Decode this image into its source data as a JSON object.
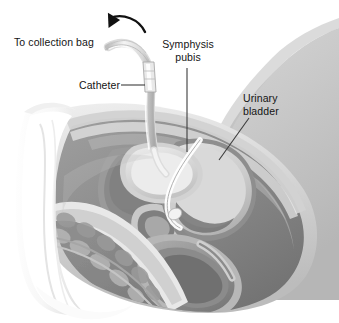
{
  "figure": {
    "type": "medical-illustration",
    "palette": {
      "background": "#ffffff",
      "body_silhouette": "#c9c9c9",
      "body_silhouette_dark": "#b4b4b4",
      "drape_white": "#fbfbfb",
      "tissue_mid": "#8f8f8f",
      "tissue_dark": "#6e6e6e",
      "tissue_light": "#d7d7d7",
      "bladder_fill": "#cfcfcf",
      "catheter_tube": "#e2e2e2",
      "catheter_outline": "#a0a0a0",
      "label_text": "#141414",
      "leader_line": "#3c3c3c",
      "arrow": "#111111"
    }
  },
  "labels": {
    "collection_bag": "To collection bag",
    "catheter": "Catheter",
    "symphysis_pubis": "Symphysis\npubis",
    "urinary_bladder": "Urinary\nbladder"
  },
  "annotations": {
    "direction_arrow": {
      "name": "curved-direction-arrow",
      "description": "curved arrow sweeping right-to-left above the catheter tubing indicating flow toward the collection bag"
    },
    "leaders": [
      {
        "name": "catheter-leader",
        "from": "Catheter label",
        "to": "catheter tubing"
      },
      {
        "name": "symphysis-leader",
        "from": "Symphysis pubis label",
        "to": "pubic symphysis bone"
      },
      {
        "name": "bladder-leader",
        "from": "Urinary bladder label",
        "to": "bladder wall"
      }
    ]
  },
  "anatomy": [
    {
      "name": "surgical-drape",
      "label": "Surgical drape"
    },
    {
      "name": "abdominal-wall",
      "label": "Abdominal wall"
    },
    {
      "name": "urinary-bladder",
      "label": "Urinary bladder"
    },
    {
      "name": "pubic-symphysis",
      "label": "Symphysis pubis"
    },
    {
      "name": "catheter-tube",
      "label": "Catheter"
    },
    {
      "name": "catheter-tip",
      "label": "Retention balloon / catheter tip"
    },
    {
      "name": "urethra",
      "label": "Urethra"
    },
    {
      "name": "rectum",
      "label": "Rectum"
    },
    {
      "name": "uterus",
      "label": "Uterus"
    },
    {
      "name": "sacrum-vertebrae",
      "label": "Sacrum and vertebrae"
    },
    {
      "name": "thigh",
      "label": "Thigh"
    }
  ]
}
